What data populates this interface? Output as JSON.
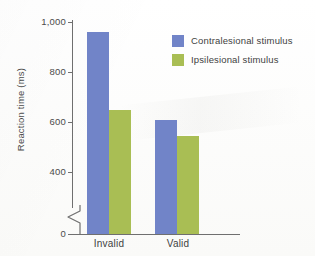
{
  "chart_data": {
    "type": "bar",
    "title": "",
    "xlabel": "",
    "ylabel": "Reaction time (ms)",
    "categories": [
      "Invalid",
      "Valid"
    ],
    "series": [
      {
        "name": "Contralesional stimulus",
        "color": "#7184c8",
        "values": [
          960,
          607
        ]
      },
      {
        "name": "Ipsilesional stimulus",
        "color": "#a9be54",
        "values": [
          650,
          545
        ]
      }
    ],
    "ylim": [
      0,
      1000
    ],
    "yticks": [
      0,
      400,
      600,
      800,
      1000
    ],
    "ytick_labels": [
      "0",
      "400",
      "600",
      "800",
      "1,000"
    ],
    "axis_break": true,
    "axis_break_between": [
      0,
      400
    ],
    "grid": false,
    "legend_position": "top-right"
  },
  "axis": {
    "y_title": "Reaction time (ms)",
    "ticks": [
      {
        "label": "1,000",
        "value": 1000
      },
      {
        "label": "800",
        "value": 800
      },
      {
        "label": "600",
        "value": 600
      },
      {
        "label": "400",
        "value": 400
      },
      {
        "label": "0",
        "value": 0
      }
    ]
  },
  "categories": [
    {
      "label": "Invalid"
    },
    {
      "label": "Valid"
    }
  ],
  "legend": {
    "items": [
      {
        "label": "Contralesional stimulus",
        "color": "#7184c8"
      },
      {
        "label": "Ipsilesional stimulus",
        "color": "#a9be54"
      }
    ]
  },
  "bars": [
    {
      "name": "invalid-contralesional",
      "value": 960
    },
    {
      "name": "invalid-ipsilesional",
      "value": 650
    },
    {
      "name": "valid-contralesional",
      "value": 607
    },
    {
      "name": "valid-ipsilesional",
      "value": 545
    }
  ]
}
